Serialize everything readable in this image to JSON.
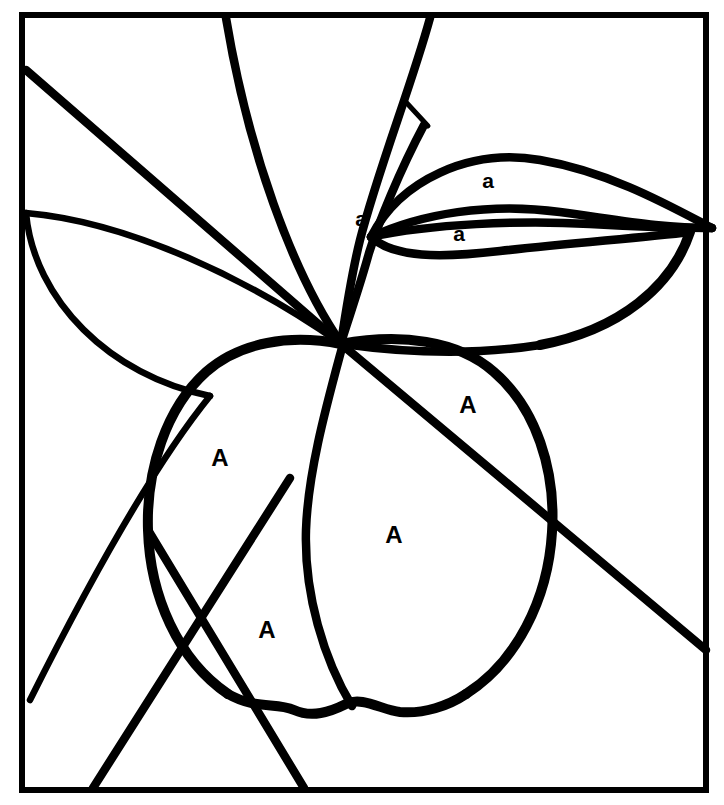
{
  "figure": {
    "background_color": "#ffffff",
    "ink_color": "#000000",
    "canvas": {
      "width": 724,
      "height": 805
    }
  },
  "frame": {
    "name": "outer-border",
    "shape": "rectangle",
    "stroke_color": "#000000",
    "stroke_width": 6,
    "x": 22,
    "y": 15,
    "width": 684,
    "height": 775
  },
  "labels": {
    "dominant_symbol": "A",
    "recessive_symbol": "a",
    "items": [
      {
        "id": "label-fruit-upper-right",
        "text": "A",
        "case": "upper",
        "x": 468,
        "y": 405,
        "region": "fruit-upper-right-segment"
      },
      {
        "id": "label-fruit-left",
        "text": "A",
        "case": "upper",
        "x": 220,
        "y": 458,
        "region": "fruit-left-segment"
      },
      {
        "id": "label-fruit-center",
        "text": "A",
        "case": "upper",
        "x": 394,
        "y": 535,
        "region": "fruit-center-segment"
      },
      {
        "id": "label-fruit-lower-left",
        "text": "A",
        "case": "upper",
        "x": 267,
        "y": 630,
        "region": "fruit-lower-left-segment"
      },
      {
        "id": "label-leaf-stem",
        "text": "a",
        "case": "lower",
        "x": 361,
        "y": 218,
        "region": "stem-vein-band"
      },
      {
        "id": "label-leaf-upper",
        "text": "a",
        "case": "lower",
        "x": 488,
        "y": 180,
        "region": "upper-right-leaf-blade"
      },
      {
        "id": "label-leaf-lower",
        "text": "a",
        "case": "lower",
        "x": 459,
        "y": 233,
        "region": "lower-right-leaf-blade"
      }
    ]
  },
  "strokes": {
    "long_diagonal_upper_left": {
      "name": "long-diagonal-from-left-border",
      "d": "M 26 70 L 340 343",
      "width": 8.5
    },
    "long_diagonal_lower_right": {
      "name": "long-diagonal-to-right-border",
      "d": "M 340 343 L 706 650",
      "width": 9
    },
    "arc_top_left_to_stem": {
      "name": "arc-top-border-to-stem",
      "d": "M 226 18 C 248 150 292 272 341 343",
      "width": 8
    },
    "left_leaf_upper_edge": {
      "name": "left-leaf-upper-edge",
      "d": "M 26 213 C 130 222 250 280 340 343",
      "width": 7.5
    },
    "left_leaf_lower_edge": {
      "name": "left-leaf-lower-edge",
      "d": "M 26 213 C 34 300 110 376 210 396",
      "width": 7.5
    },
    "left_leaf_tail": {
      "name": "left-leaf-lower-tail",
      "d": "M 210 396 C 150 470 80 600 30 700",
      "width": 7.5
    },
    "stem_main": {
      "name": "apple-stem-main-curve",
      "d": "M 430 18 C 412 84 378 170 360 240 C 353 268 346 310 341 343",
      "width": 8
    },
    "stem_inner": {
      "name": "apple-stem-inner-curve",
      "d": "M 424 125 C 400 170 378 224 369 253 C 360 286 348 320 341 343",
      "width": 8
    },
    "stem_cross_tick": {
      "name": "stem-cross-tick",
      "d": "M 404 100 L 428 126",
      "width": 6
    },
    "leaf_upper_top": {
      "name": "upper-right-leaf-top-edge",
      "d": "M 371 237 C 400 180 470 148 540 160 C 610 172 670 206 712 228",
      "width": 8
    },
    "leaf_upper_bottom": {
      "name": "upper-right-leaf-bottom-edge",
      "d": "M 371 237 C 420 214 490 202 560 212 C 620 220 660 228 712 228",
      "width": 8
    },
    "leaf_lower_top": {
      "name": "lower-right-leaf-top-edge",
      "d": "M 371 237 C 430 224 520 220 590 224 C 640 227 680 228 712 228",
      "width": 8
    },
    "leaf_lower_bottom": {
      "name": "lower-right-leaf-bottom-edge",
      "d": "M 371 237 C 394 258 440 258 500 251 C 570 243 640 238 690 232",
      "width": 8
    },
    "right_leaf_big_lower": {
      "name": "right-leaf-large-lower-edge",
      "d": "M 690 232 C 672 286 620 330 540 345",
      "width": 9
    },
    "right_leaf_big_tail": {
      "name": "right-leaf-large-tail-to-fruit",
      "d": "M 540 345 C 470 356 400 352 343 344",
      "width": 8.5
    },
    "fruit_outline_left": {
      "name": "fruit-outline-left-lobe",
      "d": "M 341 344 C 290 334 240 342 206 372 C 166 408 146 470 148 530 C 150 596 178 660 228 694",
      "width": 9
    },
    "fruit_outline_right": {
      "name": "fruit-outline-right-lobe",
      "d": "M 341 344 C 400 333 458 340 494 372 C 536 408 556 470 552 532 C 548 600 516 662 466 694",
      "width": 9
    },
    "fruit_bottom_scallop": {
      "name": "fruit-bottom-scalloped-edge",
      "d": "M 228 694 C 256 710 276 702 294 710 C 312 718 330 712 346 704 C 362 696 382 710 400 712 C 424 714 448 706 466 694",
      "width": 9
    },
    "fruit_inner_divider": {
      "name": "fruit-inner-vertical-divider",
      "d": "M 343 344 C 328 400 308 470 306 530 C 304 594 324 660 352 706",
      "width": 8
    },
    "bottom_line_left": {
      "name": "straight-line-to-bottom-border-left",
      "d": "M 290 478 L 93 788",
      "width": 8
    },
    "bottom_line_right": {
      "name": "straight-line-to-bottom-border-right",
      "d": "M 148 530 L 304 788",
      "width": 8
    }
  }
}
